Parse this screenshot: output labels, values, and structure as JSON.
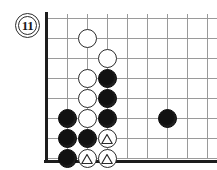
{
  "diagram": {
    "kind": "go-board-diagram",
    "move_label": "11",
    "badge_name": "diagram-number-badge",
    "background_color": "#ffffff",
    "grid_line_color": "#9a9a9a",
    "edge_color": "#1d1d1d",
    "black_stone_color": "#111111",
    "white_stone_color": "#ffffff",
    "white_stone_outline": "#2a2a2a"
  },
  "board": {
    "origin_x": 47,
    "origin_y": 18,
    "cell": 20,
    "cols": 9,
    "rows": 8,
    "left_edge": true,
    "bottom_edge": true,
    "stone_radius": 9.5
  },
  "stones": [
    {
      "color": "white",
      "col": 2,
      "row": 1,
      "mark": "",
      "label": "white-stone-c2r1"
    },
    {
      "color": "white",
      "col": 3,
      "row": 2,
      "mark": "",
      "label": "white-stone-c3r2"
    },
    {
      "color": "white",
      "col": 2,
      "row": 3,
      "mark": "",
      "label": "white-stone-c2r3"
    },
    {
      "color": "black",
      "col": 3,
      "row": 3,
      "mark": "",
      "label": "black-stone-c3r3"
    },
    {
      "color": "white",
      "col": 2,
      "row": 4,
      "mark": "",
      "label": "white-stone-c2r4"
    },
    {
      "color": "black",
      "col": 3,
      "row": 4,
      "mark": "",
      "label": "black-stone-c3r4"
    },
    {
      "color": "black",
      "col": 1,
      "row": 5,
      "mark": "",
      "label": "black-stone-c1r5"
    },
    {
      "color": "white",
      "col": 2,
      "row": 5,
      "mark": "",
      "label": "white-stone-c2r5"
    },
    {
      "color": "black",
      "col": 3,
      "row": 5,
      "mark": "",
      "label": "black-stone-c3r5"
    },
    {
      "color": "black",
      "col": 6,
      "row": 5,
      "mark": "",
      "label": "black-stone-c6r5"
    },
    {
      "color": "black",
      "col": 1,
      "row": 6,
      "mark": "",
      "label": "black-stone-c1r6"
    },
    {
      "color": "black",
      "col": 2,
      "row": 6,
      "mark": "",
      "label": "black-stone-c2r6"
    },
    {
      "color": "white",
      "col": 3,
      "row": 6,
      "mark": "triangle",
      "label": "white-stone-c3r6-triangle"
    },
    {
      "color": "black",
      "col": 1,
      "row": 7,
      "mark": "",
      "label": "black-stone-c1r7"
    },
    {
      "color": "white",
      "col": 2,
      "row": 7,
      "mark": "triangle",
      "label": "white-stone-c2r7-triangle"
    },
    {
      "color": "white",
      "col": 3,
      "row": 7,
      "mark": "triangle",
      "label": "white-stone-c3r7-triangle"
    }
  ],
  "badge": {
    "x": 15,
    "y": 13,
    "size": 25,
    "font_size": 13
  }
}
